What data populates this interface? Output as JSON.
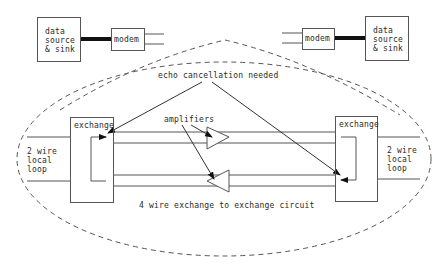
{
  "diagram": {
    "left_terminal": {
      "data_box_label": "data\nsource\n& sink",
      "modem_label": "modem"
    },
    "right_terminal": {
      "data_box_label": "data\nsource\n& sink",
      "modem_label": "modem"
    },
    "left_exchange": {
      "label": "exchange",
      "local_loop_label": "2 wire\nlocal\nloop"
    },
    "right_exchange": {
      "label": "exchange",
      "local_loop_label": "2 wire\nlocal\nloop"
    },
    "annotations": {
      "echo": "echo cancellation needed",
      "amplifiers": "amplifiers",
      "circuit": "4 wire exchange to exchange circuit"
    },
    "colors": {
      "line": "#555555",
      "thick_link": "#111111",
      "text": "#2a2a2a",
      "background": "#ffffff"
    }
  }
}
